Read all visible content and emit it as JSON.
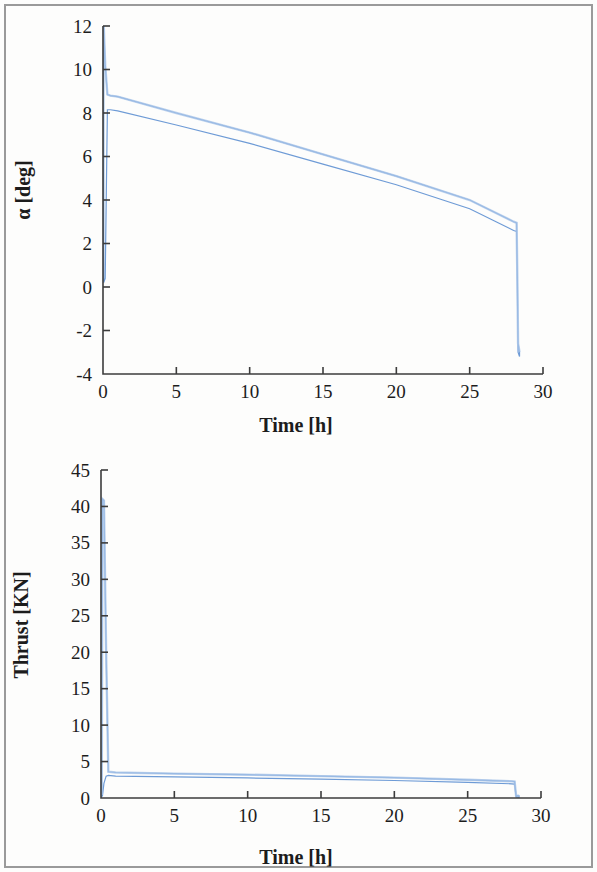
{
  "figure": {
    "background_color": "#fdfdfc",
    "border_color": "#9a9a9a",
    "line_color": "#6e9bd6",
    "line_color_light": "#a8c4e8",
    "axis_color": "#3c3c3c"
  },
  "chart_data": [
    {
      "id": "alpha-vs-time",
      "type": "line",
      "title": "",
      "xlabel": "Time [h]",
      "ylabel": "α [deg]",
      "xlim": [
        0,
        30
      ],
      "ylim": [
        -4,
        12
      ],
      "xticks": [
        0,
        5,
        10,
        15,
        20,
        25,
        30
      ],
      "xtick_labels": [
        "0",
        "5",
        "10",
        "15",
        "20",
        "25",
        "30"
      ],
      "yticks": [
        -4,
        -2,
        0,
        2,
        4,
        6,
        8,
        10,
        12
      ],
      "ytick_labels": [
        "-4",
        "-2",
        "0",
        "2",
        "4",
        "6",
        "8",
        "10",
        "12"
      ],
      "grid": false,
      "legend": "none",
      "series": [
        {
          "name": "alpha upper envelope",
          "x": [
            0.05,
            0.15,
            0.3,
            0.5,
            1.0,
            5.0,
            10.0,
            15.0,
            20.0,
            25.0,
            28.0,
            28.2,
            28.25,
            28.3,
            28.4
          ],
          "values": [
            12.0,
            10.2,
            8.85,
            8.8,
            8.75,
            8.0,
            7.1,
            6.1,
            5.1,
            4.0,
            3.0,
            2.95,
            0.5,
            -2.6,
            -3.0
          ]
        },
        {
          "name": "alpha lower envelope",
          "x": [
            0.05,
            0.15,
            0.3,
            0.5,
            1.0,
            5.0,
            10.0,
            15.0,
            20.0,
            25.0,
            28.0,
            28.2,
            28.25,
            28.3,
            28.4
          ],
          "values": [
            0.2,
            0.4,
            8.15,
            8.15,
            8.1,
            7.45,
            6.6,
            5.65,
            4.7,
            3.6,
            2.6,
            2.55,
            0.2,
            -3.0,
            -3.2
          ]
        }
      ],
      "notes": "Dense bundle of trajectories forming a narrow band that decays roughly linearly from about 8.5 deg at t=0.5 h to about 2.7 deg at t=28 h, preceded by a spike up to 12 deg near t=0 and followed by a sharp drop to about -3 deg at t=28.2 h."
    },
    {
      "id": "thrust-vs-time",
      "type": "line",
      "title": "",
      "xlabel": "Time [h]",
      "ylabel": "Thrust [KN]",
      "xlim": [
        0,
        30
      ],
      "ylim": [
        0,
        45
      ],
      "xticks": [
        0,
        5,
        10,
        15,
        20,
        25,
        30
      ],
      "xtick_labels": [
        "0",
        "5",
        "10",
        "15",
        "20",
        "25",
        "30"
      ],
      "yticks": [
        0,
        5,
        10,
        15,
        20,
        25,
        30,
        35,
        40,
        45
      ],
      "ytick_labels": [
        "0",
        "5",
        "10",
        "15",
        "20",
        "25",
        "30",
        "35",
        "40",
        "45"
      ],
      "grid": false,
      "legend": "none",
      "series": [
        {
          "name": "thrust upper envelope",
          "x": [
            0.05,
            0.1,
            0.2,
            0.35,
            0.5,
            1.0,
            5.0,
            10.0,
            15.0,
            20.0,
            25.0,
            28.0,
            28.2,
            28.3,
            28.5
          ],
          "values": [
            0.4,
            41.0,
            40.8,
            20.0,
            3.6,
            3.5,
            3.35,
            3.2,
            3.0,
            2.8,
            2.5,
            2.3,
            2.25,
            0.35,
            0.3
          ]
        },
        {
          "name": "thrust lower envelope",
          "x": [
            0.05,
            0.1,
            0.2,
            0.35,
            0.5,
            1.0,
            5.0,
            10.0,
            15.0,
            20.0,
            25.0,
            28.0,
            28.2,
            28.3,
            28.5
          ],
          "values": [
            0.2,
            0.3,
            2.0,
            3.0,
            3.1,
            3.0,
            2.9,
            2.75,
            2.6,
            2.4,
            2.15,
            1.95,
            1.9,
            0.15,
            0.1
          ]
        }
      ],
      "notes": "Initial thrust spike to about 41 KN near t=0.1 h, then a near-constant low band around 3 KN slowly decaying to about 2 KN at t=28 h, then dropping to near 0 after t=28.2 h."
    }
  ]
}
